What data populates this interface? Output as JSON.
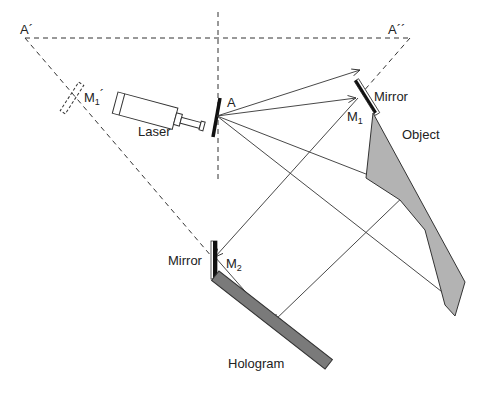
{
  "diagram": {
    "type": "holography-setup",
    "labels": {
      "a_prime": "A´",
      "a_double_prime": "A´´",
      "a": "A",
      "m1_prime": "M",
      "m1_prime_sub": "1",
      "m1_prime_mark": "´",
      "laser": "Laser",
      "mirror_1": "Mirror",
      "m1": "M",
      "m1_sub": "1",
      "object": "Object",
      "mirror_2": "Mirror",
      "m2": "M",
      "m2_sub": "2",
      "hologram": "Hologram"
    },
    "colors": {
      "line": "#333333",
      "object_fill": "#b3b3b3",
      "hologram_fill": "#7a7a7a",
      "mirror_fill": "#111111"
    },
    "components": [
      "Laser",
      "Beam splitter A",
      "Mirror M1",
      "Mirror M2",
      "Object",
      "Hologram",
      "Virtual mirror M1´"
    ],
    "rays": [
      {
        "from": "A",
        "to": "upper-right free arrow"
      },
      {
        "from": "A",
        "to": "M1"
      },
      {
        "from": "A",
        "to": "Object"
      },
      {
        "from": "A",
        "to": "lower-right free arrow"
      },
      {
        "from": "M1",
        "to": "M2"
      },
      {
        "from": "M2",
        "to": "Hologram"
      },
      {
        "from": "Object",
        "to": "Hologram"
      }
    ]
  }
}
